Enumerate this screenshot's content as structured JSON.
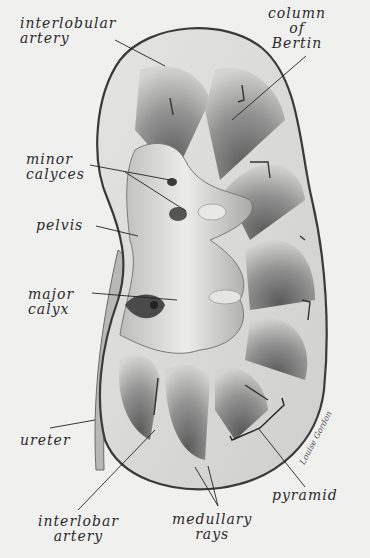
{
  "figure": {
    "signature": "Louise Gordon",
    "colors": {
      "background": "#f0f0ef",
      "ink": "#2a2a2a",
      "capsule": "#3a3a3a",
      "tissue_light": "#d9d9d7",
      "tissue_dark": "#5a5a5a"
    }
  },
  "labels": [
    {
      "id": "interlobular-artery",
      "text": "interlobular\nartery",
      "x": 20,
      "y": 16,
      "target": [
        165,
        66
      ]
    },
    {
      "id": "column-of-bertin",
      "text": "column\nof\nBertin",
      "x": 270,
      "y": 8,
      "target": [
        232,
        120
      ]
    },
    {
      "id": "minor-calyces",
      "text": "minor\ncalyces",
      "x": 30,
      "y": 152,
      "target": [
        [
          170,
          180
        ],
        [
          186,
          211
        ]
      ]
    },
    {
      "id": "pelvis",
      "text": "pelvis",
      "x": 36,
      "y": 218,
      "target": [
        138,
        236
      ]
    },
    {
      "id": "major-calyx",
      "text": "major\ncalyx",
      "x": 30,
      "y": 287,
      "target": [
        177,
        300
      ]
    },
    {
      "id": "ureter",
      "text": "ureter",
      "x": 20,
      "y": 432,
      "target": [
        95,
        420
      ]
    },
    {
      "id": "interlobar-artery",
      "text": "interlobar\nartery",
      "x": 42,
      "y": 515,
      "target": [
        155,
        430
      ]
    },
    {
      "id": "medullary-rays",
      "text": "medullary\nrays",
      "x": 175,
      "y": 512,
      "target": [
        [
          195,
          467
        ],
        [
          208,
          466
        ]
      ]
    },
    {
      "id": "pyramid",
      "text": "pyramid",
      "x": 273,
      "y": 488,
      "target": [
        258,
        428
      ]
    }
  ]
}
